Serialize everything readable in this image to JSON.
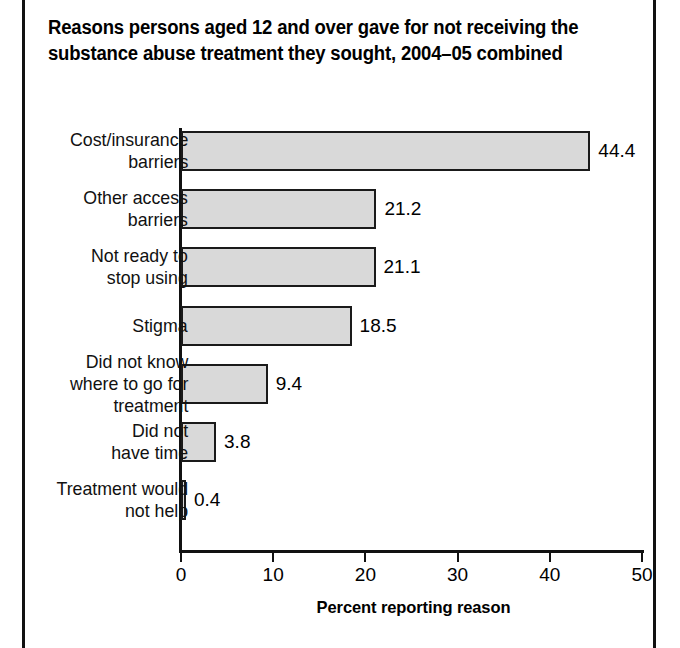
{
  "figure": {
    "title_lines": [
      "Reasons persons aged 12 and over gave for not receiving the",
      "substance abuse treatment they sought, 2004–05 combined"
    ],
    "frame_color": "#111111"
  },
  "chart_data": {
    "type": "bar",
    "orientation": "horizontal",
    "title": "Reasons persons aged 12 and over gave for not receiving the substance abuse treatment they sought, 2004–05 combined",
    "xlabel": "Percent reporting reason",
    "ylabel": "",
    "xlim": [
      0,
      50
    ],
    "xticks": [
      0,
      10,
      20,
      30,
      40,
      50
    ],
    "xticklabels": [
      "0",
      "10",
      "20",
      "30",
      "40",
      "50"
    ],
    "grid": false,
    "legend": false,
    "bar_fill_color": "#d9d9d9",
    "bar_edge_color": "#1a1a1a",
    "categories": [
      "Cost/insurance barriers",
      "Other access barriers",
      "Not ready to stop using",
      "Stigma",
      "Did not know where to go for treatment",
      "Did not have time",
      "Treatment would not help"
    ],
    "category_label_lines": [
      [
        "Cost/insurance",
        "barriers"
      ],
      [
        "Other access",
        "barriers"
      ],
      [
        "Not ready to",
        "stop using"
      ],
      [
        "Stigma"
      ],
      [
        "Did not know",
        "where to go for",
        "treatment"
      ],
      [
        "Did not",
        "have time"
      ],
      [
        "Treatment would",
        "not help"
      ]
    ],
    "values": [
      44.4,
      21.2,
      21.1,
      18.5,
      9.4,
      3.8,
      0.4
    ],
    "value_labels": [
      "44.4",
      "21.2",
      "21.1",
      "18.5",
      "9.4",
      "3.8",
      "0.4"
    ]
  }
}
